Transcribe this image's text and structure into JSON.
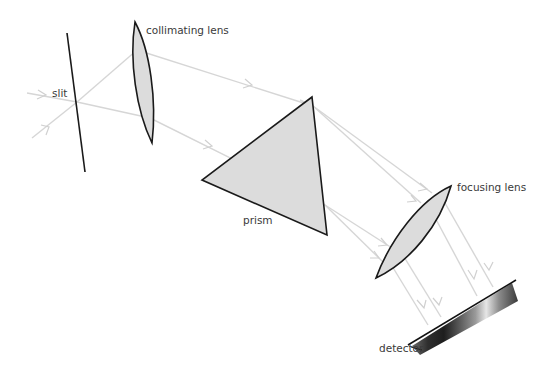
{
  "diagram": {
    "title": "",
    "type": "prism spectrometer optical layout",
    "labels": {
      "slit": "slit",
      "collimating_lens": "collimating lens",
      "prism": "prism",
      "focusing_lens": "focusing lens",
      "detector": "detector"
    },
    "components": [
      "slit",
      "collimating lens",
      "prism",
      "focusing lens",
      "detector"
    ],
    "colors": {
      "ray": "#d6d6d6",
      "optic_fill": "#dcdcdc",
      "optic_stroke": "#1a1a1a",
      "label_text": "#3a3a3a",
      "background": "#ffffff"
    }
  }
}
